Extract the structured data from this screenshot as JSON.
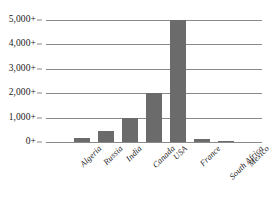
{
  "chart_data": {
    "type": "bar",
    "title": "",
    "subtitle": "",
    "xlabel": "",
    "ylabel": "",
    "categories": [
      "Algeria",
      "Russia",
      "India",
      "Canada",
      "USA",
      "France",
      "South Africa",
      "Mexico",
      "New Zealand"
    ],
    "values": [
      0,
      150,
      450,
      1000,
      2000,
      5000,
      130,
      50,
      0
    ],
    "series": [
      {
        "name": "Value",
        "values": [
          0,
          150,
          450,
          1000,
          2000,
          5000,
          130,
          50,
          0
        ]
      }
    ],
    "ylim": [
      0,
      5000
    ],
    "ytick_values": [
      0,
      1000,
      2000,
      3000,
      4000,
      5000
    ],
    "ytick_labels": [
      "0+",
      "1,000+",
      "2,000+",
      "3,000+",
      "4,000+",
      "5,000+"
    ],
    "grid": true,
    "grid_axis": "y",
    "legend": false,
    "legend_position": "none",
    "bar_color": "#6b6b6b",
    "gridline_color": "#8a8a8a",
    "background_color": "#ffffff",
    "text_color": "#1a1a1a",
    "xtick_rotation": -45,
    "annotations": []
  }
}
